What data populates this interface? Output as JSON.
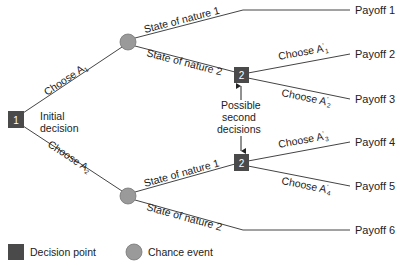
{
  "diagram": {
    "type": "decision-tree",
    "colors": {
      "decision_node": "#4a4a4a",
      "chance_node": "#9a9a9a",
      "line": "#444444",
      "text": "#222222"
    },
    "nodes": {
      "initial": {
        "label": "1",
        "caption_line1": "Initial",
        "caption_line2": "decision"
      },
      "second_top": {
        "label": "2"
      },
      "second_bottom": {
        "label": "2"
      }
    },
    "branches": {
      "choose_a1": {
        "text": "Choose A",
        "sub": "1"
      },
      "choose_a2": {
        "text": "Choose A",
        "sub": "2"
      },
      "upper_state1": "State of nature 1",
      "upper_state2": "State of nature 2",
      "lower_state1": "State of nature 1",
      "lower_state2": "State of nature 2",
      "choose_a1p": {
        "text": "Choose A",
        "prime": "'",
        "sub": "1"
      },
      "choose_a2p": {
        "text": "Choose A",
        "prime": "'",
        "sub": "2"
      },
      "choose_a3p": {
        "text": "Choose A",
        "prime": "'",
        "sub": "3"
      },
      "choose_a4p": {
        "text": "Choose A",
        "prime": "'",
        "sub": "4"
      }
    },
    "annotation": {
      "line1": "Possible",
      "line2": "second",
      "line3": "decisions"
    },
    "payoffs": [
      "Payoff 1",
      "Payoff 2",
      "Payoff 3",
      "Payoff 4",
      "Payoff 5",
      "Payoff 6"
    ],
    "legend": {
      "decision": "Decision point",
      "chance": "Chance event"
    }
  }
}
